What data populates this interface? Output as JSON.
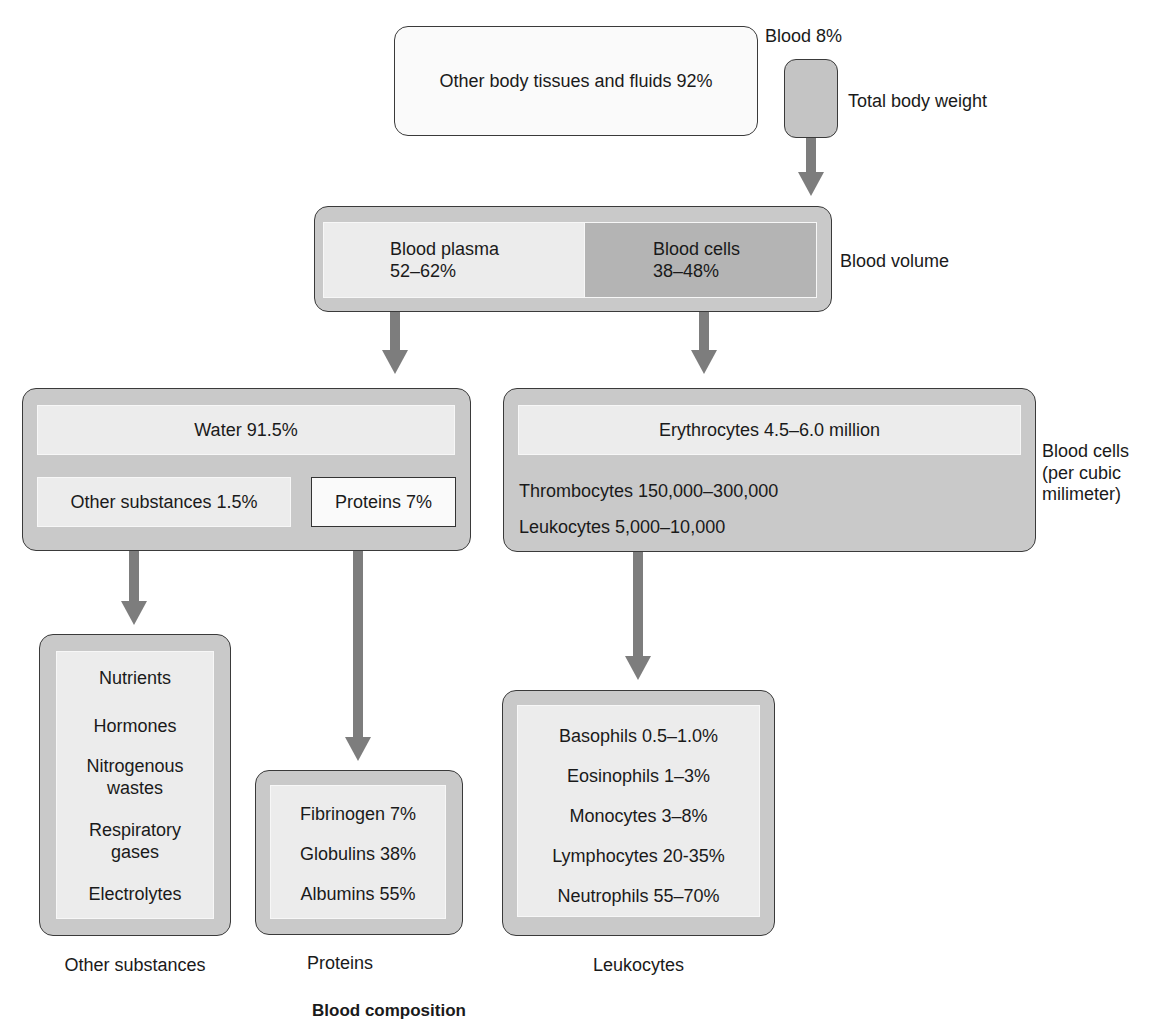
{
  "title": "Blood composition",
  "body_weight": {
    "other_label": "Other body tissues and fluids 92%",
    "blood_label": "Blood 8%",
    "side_label": "Total body weight"
  },
  "blood_volume": {
    "plasma_name": "Blood plasma",
    "plasma_value": "52–62%",
    "cells_name": "Blood cells",
    "cells_value": "38–48%",
    "side_label": "Blood volume"
  },
  "plasma": {
    "water": "Water 91.5%",
    "other_substances": "Other substances 1.5%",
    "proteins": "Proteins 7%"
  },
  "blood_cells": {
    "erythrocytes": "Erythrocytes 4.5–6.0 million",
    "thrombocytes": "Thrombocytes 150,000–300,000",
    "leukocytes": "Leukocytes 5,000–10,000",
    "side_label_line1": "Blood cells",
    "side_label_line2": "(per cubic",
    "side_label_line3": "milimeter)"
  },
  "other_substances": {
    "items": [
      "Nutrients",
      "Hormones",
      "Nitrogenous wastes",
      "Respiratory gases",
      "Electrolytes"
    ],
    "caption": "Other substances"
  },
  "proteins": {
    "items": [
      "Fibrinogen 7%",
      "Globulins 38%",
      "Albumins 55%"
    ],
    "caption": "Proteins"
  },
  "leukocytes": {
    "items": [
      "Basophils 0.5–1.0%",
      "Eosinophils 1–3%",
      "Monocytes 3–8%",
      "Lymphocytes 20-35%",
      "Neutrophils 55–70%"
    ],
    "caption": "Leukocytes"
  },
  "colors": {
    "outer_box": "#c9c9c9",
    "inner_box": "#ececec",
    "blood_cells_fill": "#b4b4b4",
    "arrow": "#7d7d7d",
    "light_box": "#fafafa"
  }
}
